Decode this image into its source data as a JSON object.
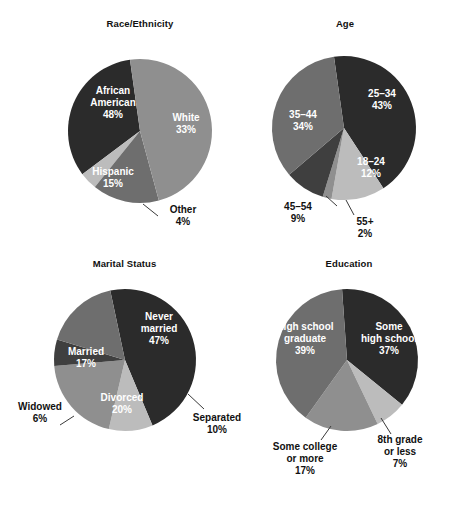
{
  "figure": {
    "title": "",
    "background": "#ffffff",
    "palette": {
      "dark": "#2b2b2b",
      "mid": "#6e6e6e",
      "mid_dark": "#4a4a4a",
      "mid_light": "#8f8f8f",
      "light": "#bcbcbc",
      "text_dark": "#111111",
      "text_light": "#ffffff",
      "leader": "#3a3a3a"
    }
  },
  "chart_data": [
    {
      "type": "pie",
      "title": "Race/Ethnicity",
      "xlabel": "",
      "ylabel": "",
      "units": "percent",
      "start_angle_deg": -8,
      "direction": "clockwise",
      "categories": [
        "White",
        "Other",
        "Hispanic",
        "African American"
      ],
      "values": [
        33,
        4,
        15,
        48
      ],
      "colors": [
        "#2b2b2b",
        "#bcbcbc",
        "#6e6e6e",
        "#8f8f8f"
      ],
      "labels": [
        {
          "name": "White",
          "pct": "33%",
          "placement": "inside",
          "text_color": "#ffffff"
        },
        {
          "name": "Other",
          "pct": "4%",
          "placement": "outside",
          "text_color": "#111111"
        },
        {
          "name": "Hispanic",
          "pct": "15%",
          "placement": "inside",
          "text_color": "#ffffff"
        },
        {
          "name": "African American",
          "pct": "48%",
          "placement": "inside",
          "text_color": "#ffffff"
        }
      ]
    },
    {
      "type": "pie",
      "title": "Age",
      "xlabel": "",
      "ylabel": "",
      "units": "percent",
      "start_angle_deg": -8,
      "direction": "clockwise",
      "categories": [
        "25–34",
        "18–24",
        "55+",
        "45–54",
        "35–44"
      ],
      "values": [
        43,
        12,
        2,
        9,
        34
      ],
      "colors": [
        "#2b2b2b",
        "#bcbcbc",
        "#8f8f8f",
        "#3f3f3f",
        "#6e6e6e"
      ],
      "labels": [
        {
          "name": "25–34",
          "pct": "43%",
          "placement": "inside",
          "text_color": "#ffffff"
        },
        {
          "name": "18–24",
          "pct": "12%",
          "placement": "inside",
          "text_color": "#ffffff"
        },
        {
          "name": "55+",
          "pct": "2%",
          "placement": "outside",
          "text_color": "#111111"
        },
        {
          "name": "45–54",
          "pct": "9%",
          "placement": "outside",
          "text_color": "#111111"
        },
        {
          "name": "35–44",
          "pct": "34%",
          "placement": "inside",
          "text_color": "#ffffff"
        }
      ]
    },
    {
      "type": "pie",
      "title": "Marital Status",
      "xlabel": "",
      "ylabel": "",
      "units": "percent",
      "start_angle_deg": -12,
      "direction": "clockwise",
      "categories": [
        "Never married",
        "Separated",
        "Divorced",
        "Widowed",
        "Married"
      ],
      "values": [
        47,
        10,
        20,
        6,
        17
      ],
      "colors": [
        "#2b2b2b",
        "#bcbcbc",
        "#8f8f8f",
        "#3f3f3f",
        "#6e6e6e"
      ],
      "labels": [
        {
          "name": "Never married",
          "pct": "47%",
          "placement": "inside",
          "text_color": "#ffffff"
        },
        {
          "name": "Separated",
          "pct": "10%",
          "placement": "outside",
          "text_color": "#111111"
        },
        {
          "name": "Divorced",
          "pct": "20%",
          "placement": "inside",
          "text_color": "#ffffff"
        },
        {
          "name": "Widowed",
          "pct": "6%",
          "placement": "outside",
          "text_color": "#111111"
        },
        {
          "name": "Married",
          "pct": "17%",
          "placement": "inside",
          "text_color": "#ffffff"
        }
      ]
    },
    {
      "type": "pie",
      "title": "Education",
      "xlabel": "",
      "ylabel": "",
      "units": "percent",
      "start_angle_deg": -4,
      "direction": "clockwise",
      "categories": [
        "Some high school",
        "8th grade or less",
        "Some college or more",
        "High school graduate"
      ],
      "values": [
        37,
        7,
        17,
        39
      ],
      "colors": [
        "#2b2b2b",
        "#bcbcbc",
        "#8f8f8f",
        "#6e6e6e"
      ],
      "labels": [
        {
          "name": "Some high school",
          "pct": "37%",
          "placement": "inside",
          "text_color": "#ffffff"
        },
        {
          "name": "8th grade or less",
          "pct": "7%",
          "placement": "outside",
          "text_color": "#111111"
        },
        {
          "name": "Some college or more",
          "pct": "17%",
          "placement": "outside",
          "text_color": "#111111"
        },
        {
          "name": "High school graduate",
          "pct": "39%",
          "placement": "inside",
          "text_color": "#ffffff"
        }
      ]
    }
  ],
  "panels": {
    "race": {
      "title": "Race/Ethnicity",
      "inside": [
        {
          "l1": "African",
          "l2": "American",
          "l3": "48%"
        },
        {
          "l1": "White",
          "l2": "33%"
        },
        {
          "l1": "Hispanic",
          "l2": "15%"
        }
      ],
      "outside": [
        {
          "l1": "Other",
          "l2": "4%"
        }
      ]
    },
    "age": {
      "title": "Age",
      "inside": [
        {
          "l1": "25–34",
          "l2": "43%"
        },
        {
          "l1": "35–44",
          "l2": "34%"
        },
        {
          "l1": "18–24",
          "l2": "12%"
        }
      ],
      "outside": [
        {
          "l1": "45–54",
          "l2": "9%"
        },
        {
          "l1": "55+",
          "l2": "2%"
        }
      ]
    },
    "marital": {
      "title": "Marital Status",
      "inside": [
        {
          "l1": "Never",
          "l2": "married",
          "l3": "47%"
        },
        {
          "l1": "Married",
          "l2": "17%"
        },
        {
          "l1": "Divorced",
          "l2": "20%"
        }
      ],
      "outside": [
        {
          "l1": "Widowed",
          "l2": "6%"
        },
        {
          "l1": "Separated",
          "l2": "10%"
        }
      ]
    },
    "education": {
      "title": "Education",
      "inside": [
        {
          "l1": "High school",
          "l2": "graduate",
          "l3": "39%"
        },
        {
          "l1": "Some",
          "l2": "high school",
          "l3": "37%"
        }
      ],
      "outside": [
        {
          "l1": "8th grade",
          "l2": "or less",
          "l3": "7%"
        },
        {
          "l1": "Some college",
          "l2": "or more",
          "l3": "17%"
        }
      ]
    }
  }
}
